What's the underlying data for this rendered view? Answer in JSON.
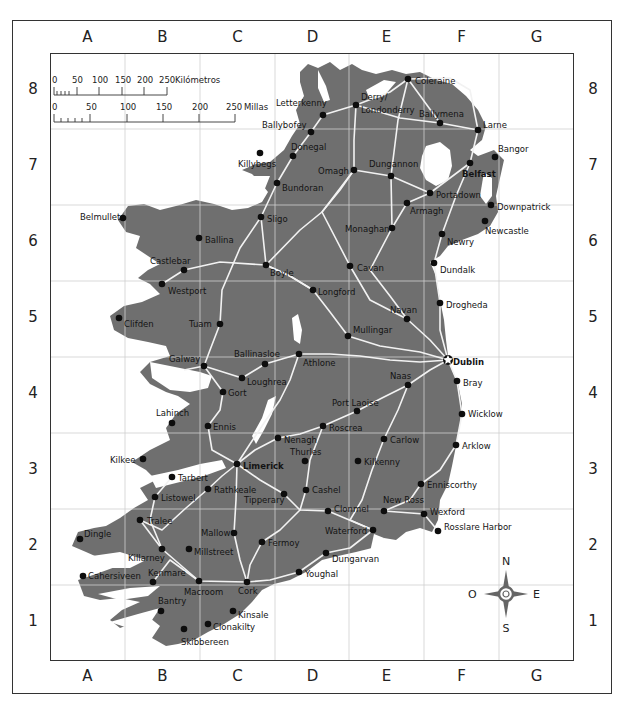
{
  "map": {
    "land_color": "#6f6f6f",
    "water_color": "#ffffff",
    "road_color": "#f2f2f2",
    "grid_color": "#cfcfcf",
    "frame_color": "#333333",
    "text_color": "#1a1a1a"
  },
  "grid": {
    "columns": [
      "A",
      "B",
      "C",
      "D",
      "E",
      "F",
      "G"
    ],
    "rows": [
      "8",
      "7",
      "6",
      "5",
      "4",
      "3",
      "2",
      "1"
    ]
  },
  "scale_bar": {
    "km_ticks": [
      "0",
      "50",
      "100",
      "150",
      "200",
      "250"
    ],
    "km_unit": "Kilómetros",
    "mi_ticks": [
      "0",
      "50",
      "100",
      "150",
      "200",
      "250"
    ],
    "mi_unit": "Millas"
  },
  "compass": {
    "north": "N",
    "south": "S",
    "east": "E",
    "west": "O"
  },
  "cities": [
    {
      "name": "Coleraine",
      "x": 408,
      "y": 79,
      "lx": 415,
      "ly": 84,
      "bold": false,
      "capital": false
    },
    {
      "name": "Letterkenny",
      "x": 323,
      "y": 115,
      "lx": 276,
      "ly": 106,
      "bold": false,
      "capital": false
    },
    {
      "name": "Derry/",
      "x": 356,
      "y": 105,
      "lx": 361,
      "ly": 100,
      "bold": false,
      "capital": false
    },
    {
      "name": "Londonderry",
      "x": -1,
      "y": -1,
      "lx": 361,
      "ly": 113,
      "bold": false,
      "capital": false,
      "label_only": true
    },
    {
      "name": "Ballymena",
      "x": 440,
      "y": 123,
      "lx": 419,
      "ly": 117,
      "bold": false,
      "capital": false
    },
    {
      "name": "Larne",
      "x": 478,
      "y": 130,
      "lx": 483,
      "ly": 128,
      "bold": false,
      "capital": false
    },
    {
      "name": "Ballybofey",
      "x": 311,
      "y": 132,
      "lx": 262,
      "ly": 128,
      "bold": false,
      "capital": false
    },
    {
      "name": "Donegal",
      "x": 293,
      "y": 156,
      "lx": 291,
      "ly": 150,
      "bold": false,
      "capital": false
    },
    {
      "name": "Killybegs",
      "x": 260,
      "y": 153,
      "lx": 238,
      "ly": 167,
      "bold": false,
      "capital": false
    },
    {
      "name": "Bangor",
      "x": 495,
      "y": 157,
      "lx": 498,
      "ly": 152,
      "bold": false,
      "capital": false
    },
    {
      "name": "Omagh",
      "x": 354,
      "y": 170,
      "lx": 318,
      "ly": 174,
      "bold": false,
      "capital": false
    },
    {
      "name": "Dungannon",
      "x": 391,
      "y": 176,
      "lx": 369,
      "ly": 167,
      "bold": false,
      "capital": false
    },
    {
      "name": "Belfast",
      "x": 470,
      "y": 163,
      "lx": 462,
      "ly": 177,
      "bold": true,
      "capital": false
    },
    {
      "name": "Bundoran",
      "x": 277,
      "y": 183,
      "lx": 282,
      "ly": 191,
      "bold": false,
      "capital": false
    },
    {
      "name": "Portadown",
      "x": 430,
      "y": 193,
      "lx": 436,
      "ly": 198,
      "bold": false,
      "capital": false
    },
    {
      "name": "Armagh",
      "x": 407,
      "y": 203,
      "lx": 410,
      "ly": 214,
      "bold": false,
      "capital": false
    },
    {
      "name": "Downpatrick",
      "x": 491,
      "y": 205,
      "lx": 497,
      "ly": 210,
      "bold": false,
      "capital": false
    },
    {
      "name": "Belmullet",
      "x": 123,
      "y": 218,
      "lx": 80,
      "ly": 220,
      "bold": false,
      "capital": false
    },
    {
      "name": "Sligo",
      "x": 261,
      "y": 217,
      "lx": 267,
      "ly": 222,
      "bold": false,
      "capital": false
    },
    {
      "name": "Newcastle",
      "x": 485,
      "y": 221,
      "lx": 485,
      "ly": 234,
      "bold": false,
      "capital": false
    },
    {
      "name": "Monaghan",
      "x": 392,
      "y": 228,
      "lx": 345,
      "ly": 232,
      "bold": false,
      "capital": false
    },
    {
      "name": "Ballina",
      "x": 199,
      "y": 238,
      "lx": 205,
      "ly": 243,
      "bold": false,
      "capital": false
    },
    {
      "name": "Newry",
      "x": 442,
      "y": 234,
      "lx": 447,
      "ly": 245,
      "bold": false,
      "capital": false
    },
    {
      "name": "Castlebar",
      "x": 184,
      "y": 270,
      "lx": 150,
      "ly": 264,
      "bold": false,
      "capital": false
    },
    {
      "name": "Boyle",
      "x": 266,
      "y": 265,
      "lx": 270,
      "ly": 276,
      "bold": false,
      "capital": false
    },
    {
      "name": "Cavan",
      "x": 350,
      "y": 266,
      "lx": 357,
      "ly": 271,
      "bold": false,
      "capital": false
    },
    {
      "name": "Dundalk",
      "x": 434,
      "y": 263,
      "lx": 440,
      "ly": 273,
      "bold": false,
      "capital": false
    },
    {
      "name": "Westport",
      "x": 162,
      "y": 284,
      "lx": 168,
      "ly": 294,
      "bold": false,
      "capital": false
    },
    {
      "name": "Longford",
      "x": 313,
      "y": 290,
      "lx": 318,
      "ly": 295,
      "bold": false,
      "capital": false
    },
    {
      "name": "Drogheda",
      "x": 440,
      "y": 303,
      "lx": 446,
      "ly": 308,
      "bold": false,
      "capital": false
    },
    {
      "name": "Clifden",
      "x": 119,
      "y": 318,
      "lx": 124,
      "ly": 327,
      "bold": false,
      "capital": false
    },
    {
      "name": "Tuam",
      "x": 220,
      "y": 324,
      "lx": 189,
      "ly": 327,
      "bold": false,
      "capital": false
    },
    {
      "name": "Navan",
      "x": 407,
      "y": 319,
      "lx": 390,
      "ly": 313,
      "bold": false,
      "capital": false
    },
    {
      "name": "Mullingar",
      "x": 348,
      "y": 336,
      "lx": 353,
      "ly": 333,
      "bold": false,
      "capital": false
    },
    {
      "name": "Dublin",
      "x": 448,
      "y": 360,
      "lx": 453,
      "ly": 365,
      "bold": true,
      "capital": true
    },
    {
      "name": "Ballinasloe",
      "x": 265,
      "y": 364,
      "lx": 234,
      "ly": 357,
      "bold": false,
      "capital": false
    },
    {
      "name": "Athlone",
      "x": 299,
      "y": 354,
      "lx": 303,
      "ly": 366,
      "bold": false,
      "capital": false
    },
    {
      "name": "Galway",
      "x": 204,
      "y": 366,
      "lx": 169,
      "ly": 362,
      "bold": false,
      "capital": false
    },
    {
      "name": "Bray",
      "x": 457,
      "y": 381,
      "lx": 463,
      "ly": 386,
      "bold": false,
      "capital": false
    },
    {
      "name": "Loughrea",
      "x": 242,
      "y": 378,
      "lx": 247,
      "ly": 385,
      "bold": false,
      "capital": false
    },
    {
      "name": "Naas",
      "x": 408,
      "y": 385,
      "lx": 390,
      "ly": 379,
      "bold": false,
      "capital": false
    },
    {
      "name": "Gort",
      "x": 223,
      "y": 392,
      "lx": 228,
      "ly": 396,
      "bold": false,
      "capital": false
    },
    {
      "name": "Port Laoise",
      "x": 357,
      "y": 411,
      "lx": 332,
      "ly": 406,
      "bold": false,
      "capital": false
    },
    {
      "name": "Wicklow",
      "x": 462,
      "y": 414,
      "lx": 468,
      "ly": 417,
      "bold": false,
      "capital": false
    },
    {
      "name": "Lahinch",
      "x": 172,
      "y": 423,
      "lx": 156,
      "ly": 416,
      "bold": false,
      "capital": false
    },
    {
      "name": "Ennis",
      "x": 208,
      "y": 426,
      "lx": 213,
      "ly": 430,
      "bold": false,
      "capital": false
    },
    {
      "name": "Roscrea",
      "x": 323,
      "y": 426,
      "lx": 329,
      "ly": 431,
      "bold": false,
      "capital": false
    },
    {
      "name": "Nenagh",
      "x": 278,
      "y": 438,
      "lx": 284,
      "ly": 443,
      "bold": false,
      "capital": false
    },
    {
      "name": "Carlow",
      "x": 384,
      "y": 439,
      "lx": 390,
      "ly": 443,
      "bold": false,
      "capital": false
    },
    {
      "name": "Arklow",
      "x": 456,
      "y": 445,
      "lx": 462,
      "ly": 449,
      "bold": false,
      "capital": false
    },
    {
      "name": "Thurles",
      "x": 305,
      "y": 461,
      "lx": 290,
      "ly": 455,
      "bold": false,
      "capital": false
    },
    {
      "name": "Kilkee",
      "x": 143,
      "y": 459,
      "lx": 110,
      "ly": 463,
      "bold": false,
      "capital": false
    },
    {
      "name": "Kilkenny",
      "x": 358,
      "y": 461,
      "lx": 364,
      "ly": 465,
      "bold": false,
      "capital": false
    },
    {
      "name": "Limerick",
      "x": 237,
      "y": 464,
      "lx": 243,
      "ly": 469,
      "bold": true,
      "capital": false
    },
    {
      "name": "Tarbert",
      "x": 172,
      "y": 477,
      "lx": 178,
      "ly": 481,
      "bold": false,
      "capital": false
    },
    {
      "name": "Enniscorthy",
      "x": 421,
      "y": 484,
      "lx": 427,
      "ly": 488,
      "bold": false,
      "capital": false
    },
    {
      "name": "Rathkeale",
      "x": 208,
      "y": 489,
      "lx": 214,
      "ly": 493,
      "bold": false,
      "capital": false
    },
    {
      "name": "Cashel",
      "x": 306,
      "y": 490,
      "lx": 312,
      "ly": 493,
      "bold": false,
      "capital": false
    },
    {
      "name": "Tipperary",
      "x": 284,
      "y": 494,
      "lx": 244,
      "ly": 503,
      "bold": false,
      "capital": false
    },
    {
      "name": "Listowel",
      "x": 155,
      "y": 497,
      "lx": 161,
      "ly": 501,
      "bold": false,
      "capital": false
    },
    {
      "name": "Clonmel",
      "x": 328,
      "y": 511,
      "lx": 334,
      "ly": 512,
      "bold": false,
      "capital": false
    },
    {
      "name": "New Ross",
      "x": 384,
      "y": 511,
      "lx": 383,
      "ly": 503,
      "bold": false,
      "capital": false
    },
    {
      "name": "Wexford",
      "x": 424,
      "y": 514,
      "lx": 430,
      "ly": 515,
      "bold": false,
      "capital": false
    },
    {
      "name": "Tralee",
      "x": 140,
      "y": 520,
      "lx": 147,
      "ly": 524,
      "bold": false,
      "capital": false
    },
    {
      "name": "Waterford",
      "x": 373,
      "y": 530,
      "lx": 325,
      "ly": 534,
      "bold": false,
      "capital": false
    },
    {
      "name": "Rosslare Harbor",
      "x": 438,
      "y": 531,
      "lx": 444,
      "ly": 530,
      "bold": false,
      "capital": false
    },
    {
      "name": "Mallow",
      "x": 234,
      "y": 533,
      "lx": 201,
      "ly": 536,
      "bold": false,
      "capital": false
    },
    {
      "name": "Dingle",
      "x": 80,
      "y": 539,
      "lx": 84,
      "ly": 537,
      "bold": false,
      "capital": false
    },
    {
      "name": "Fermoy",
      "x": 262,
      "y": 542,
      "lx": 268,
      "ly": 546,
      "bold": false,
      "capital": false
    },
    {
      "name": "Killarney",
      "x": 162,
      "y": 549,
      "lx": 128,
      "ly": 561,
      "bold": false,
      "capital": false
    },
    {
      "name": "Millstreet",
      "x": 189,
      "y": 549,
      "lx": 194,
      "ly": 555,
      "bold": false,
      "capital": false
    },
    {
      "name": "Dungarvan",
      "x": 326,
      "y": 553,
      "lx": 332,
      "ly": 562,
      "bold": false,
      "capital": false
    },
    {
      "name": "Cahersiveen",
      "x": 83,
      "y": 576,
      "lx": 88,
      "ly": 579,
      "bold": false,
      "capital": false
    },
    {
      "name": "Kenmare",
      "x": 153,
      "y": 582,
      "lx": 148,
      "ly": 576,
      "bold": false,
      "capital": false
    },
    {
      "name": "Youghal",
      "x": 299,
      "y": 572,
      "lx": 305,
      "ly": 577,
      "bold": false,
      "capital": false
    },
    {
      "name": "Macroom",
      "x": 199,
      "y": 581,
      "lx": 184,
      "ly": 595,
      "bold": false,
      "capital": false
    },
    {
      "name": "Cork",
      "x": 247,
      "y": 582,
      "lx": 238,
      "ly": 594,
      "bold": false,
      "capital": false
    },
    {
      "name": "Bantry",
      "x": 161,
      "y": 611,
      "lx": 158,
      "ly": 604,
      "bold": false,
      "capital": false
    },
    {
      "name": "Kinsale",
      "x": 233,
      "y": 611,
      "lx": 238,
      "ly": 618,
      "bold": false,
      "capital": false
    },
    {
      "name": "Clonakilty",
      "x": 208,
      "y": 624,
      "lx": 213,
      "ly": 630,
      "bold": false,
      "capital": false
    },
    {
      "name": "Skibbereen",
      "x": 184,
      "y": 629,
      "lx": 181,
      "ly": 645,
      "bold": false,
      "capital": false
    }
  ]
}
